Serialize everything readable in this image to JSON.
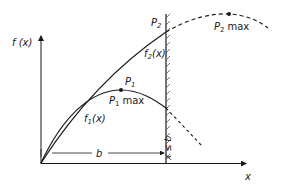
{
  "diagram": {
    "axes": {
      "y_label": "f (x)",
      "x_label": "x"
    },
    "curves": {
      "f1": {
        "label_base": "f",
        "label_sub": "1",
        "label_arg": "(x)"
      },
      "f2": {
        "label_base": "f",
        "label_sub": "2",
        "label_arg": "(x)"
      }
    },
    "points": {
      "p1": {
        "base": "P",
        "sub": "1"
      },
      "p1_max": {
        "base": "P",
        "sub": "1",
        "suffix": "max"
      },
      "p2": {
        "base": "P",
        "sub": "2"
      },
      "p2_max": {
        "base": "P",
        "sub": "2",
        "suffix": "max"
      }
    },
    "dimension": {
      "label": "b"
    },
    "constraint": {
      "label": "x ≤ b"
    },
    "colors": {
      "ink": "#1a1a1a",
      "background": "#ffffff"
    }
  }
}
